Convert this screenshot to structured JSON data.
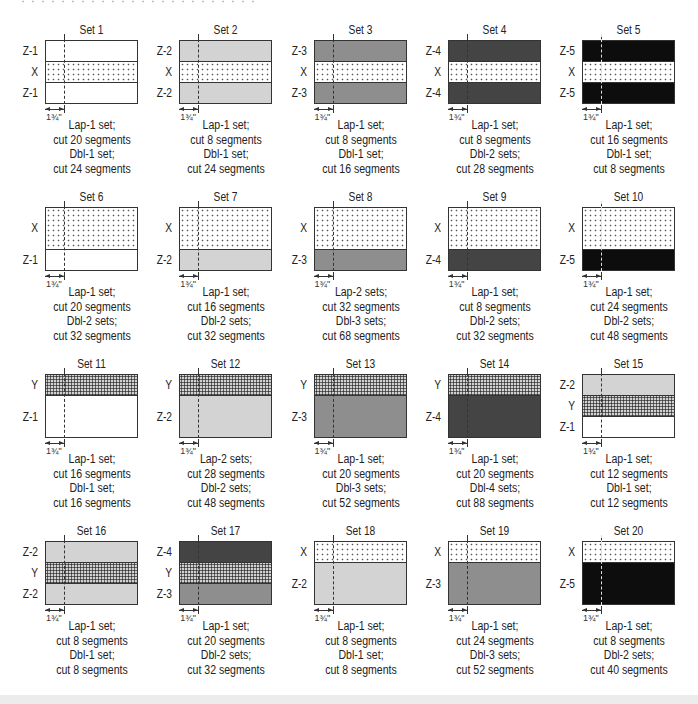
{
  "diagram": {
    "measure_label": "1¾\"",
    "colors": {
      "Z-1": "#ffffff",
      "Z-2": "#d3d3d3",
      "Z-3": "#8e8e8e",
      "Z-4": "#444444",
      "Z-5": "#0d0d0d",
      "X": "dotted white",
      "Y": "dense crosshatch gray"
    },
    "sets": [
      {
        "title": "Set 1",
        "strips": [
          {
            "label": "Z-1",
            "fill": "Z-1",
            "h": 1
          },
          {
            "label": "X",
            "fill": "X",
            "h": 1
          },
          {
            "label": "Z-1",
            "fill": "Z-1",
            "h": 1
          }
        ],
        "caption": [
          "Lap-1 set;",
          "cut 20 segments",
          "Dbl-1 set;",
          "cut 24 segments"
        ]
      },
      {
        "title": "Set 2",
        "strips": [
          {
            "label": "Z-2",
            "fill": "Z-2",
            "h": 1
          },
          {
            "label": "X",
            "fill": "X",
            "h": 1
          },
          {
            "label": "Z-2",
            "fill": "Z-2",
            "h": 1
          }
        ],
        "caption": [
          "Lap-1 set;",
          "cut 8 segments",
          "Dbl-1 set;",
          "cut 24 segments"
        ]
      },
      {
        "title": "Set 3",
        "strips": [
          {
            "label": "Z-3",
            "fill": "Z-3",
            "h": 1
          },
          {
            "label": "X",
            "fill": "X",
            "h": 1
          },
          {
            "label": "Z-3",
            "fill": "Z-3",
            "h": 1
          }
        ],
        "caption": [
          "Lap-1 set;",
          "cut 8 segments",
          "Dbl-1 set;",
          "cut 16 segments"
        ]
      },
      {
        "title": "Set 4",
        "strips": [
          {
            "label": "Z-4",
            "fill": "Z-4",
            "h": 1
          },
          {
            "label": "X",
            "fill": "X",
            "h": 1
          },
          {
            "label": "Z-4",
            "fill": "Z-4",
            "h": 1
          }
        ],
        "caption": [
          "Lap-1 set;",
          "cut 8 segments",
          "Dbl-2 sets;",
          "cut 28 segments"
        ]
      },
      {
        "title": "Set 5",
        "strips": [
          {
            "label": "Z-5",
            "fill": "Z-5",
            "h": 1
          },
          {
            "label": "X",
            "fill": "X",
            "h": 1
          },
          {
            "label": "Z-5",
            "fill": "Z-5",
            "h": 1
          }
        ],
        "caption": [
          "Lap-1 set;",
          "cut 16 segments",
          "Dbl-1 set;",
          "cut 8 segments"
        ]
      },
      {
        "title": "Set 6",
        "strips": [
          {
            "label": "X",
            "fill": "X",
            "h": 2
          },
          {
            "label": "Z-1",
            "fill": "Z-1",
            "h": 1
          }
        ],
        "caption": [
          "Lap-1 set;",
          "cut 20 segments",
          "Dbl-2 sets;",
          "cut 32 segments"
        ]
      },
      {
        "title": "Set 7",
        "strips": [
          {
            "label": "X",
            "fill": "X",
            "h": 2
          },
          {
            "label": "Z-2",
            "fill": "Z-2",
            "h": 1
          }
        ],
        "caption": [
          "Lap-1 set;",
          "cut 16 segments",
          "Dbl-2 sets;",
          "cut 32 segments"
        ]
      },
      {
        "title": "Set 8",
        "strips": [
          {
            "label": "X",
            "fill": "X",
            "h": 2
          },
          {
            "label": "Z-3",
            "fill": "Z-3",
            "h": 1
          }
        ],
        "caption": [
          "Lap-2 sets;",
          "cut 32 segments",
          "Dbl-3 sets;",
          "cut 68 segments"
        ]
      },
      {
        "title": "Set 9",
        "strips": [
          {
            "label": "X",
            "fill": "X",
            "h": 2
          },
          {
            "label": "Z-4",
            "fill": "Z-4",
            "h": 1
          }
        ],
        "caption": [
          "Lap-1 set;",
          "cut 8 segments",
          "Dbl-2 sets;",
          "cut 32 segments"
        ]
      },
      {
        "title": "Set 10",
        "strips": [
          {
            "label": "X",
            "fill": "X",
            "h": 2
          },
          {
            "label": "Z-5",
            "fill": "Z-5",
            "h": 1
          }
        ],
        "caption": [
          "Lap-1 set;",
          "cut 24 segments",
          "Dbl-2 sets;",
          "cut 48 segments"
        ]
      },
      {
        "title": "Set 11",
        "strips": [
          {
            "label": "Y",
            "fill": "Y",
            "h": 1
          },
          {
            "label": "Z-1",
            "fill": "Z-1",
            "h": 2
          }
        ],
        "caption": [
          "Lap-1 set;",
          "cut 16 segments",
          "Dbl-1 set;",
          "cut 16 segments"
        ]
      },
      {
        "title": "Set 12",
        "strips": [
          {
            "label": "Y",
            "fill": "Y",
            "h": 1
          },
          {
            "label": "Z-2",
            "fill": "Z-2",
            "h": 2
          }
        ],
        "caption": [
          "Lap-2 sets;",
          "cut 28 segments",
          "Dbl-2 sets;",
          "cut 48 segments"
        ]
      },
      {
        "title": "Set 13",
        "strips": [
          {
            "label": "Y",
            "fill": "Y",
            "h": 1
          },
          {
            "label": "Z-3",
            "fill": "Z-3",
            "h": 2
          }
        ],
        "caption": [
          "Lap-1 set;",
          "cut 20 segments",
          "Dbl-3 sets;",
          "cut 52 segments"
        ]
      },
      {
        "title": "Set 14",
        "strips": [
          {
            "label": "Y",
            "fill": "Y",
            "h": 1
          },
          {
            "label": "Z-4",
            "fill": "Z-4",
            "h": 2
          }
        ],
        "caption": [
          "Lap-1 set;",
          "cut 20 segments",
          "Dbl-4 sets;",
          "cut 88 segments"
        ]
      },
      {
        "title": "Set 15",
        "strips": [
          {
            "label": "Z-2",
            "fill": "Z-2",
            "h": 1
          },
          {
            "label": "Y",
            "fill": "Y",
            "h": 1
          },
          {
            "label": "Z-1",
            "fill": "Z-1",
            "h": 1
          }
        ],
        "caption": [
          "Lap-1 set;",
          "cut 12 segments",
          "Dbl-1 set;",
          "cut 12 segments"
        ]
      },
      {
        "title": "Set 16",
        "strips": [
          {
            "label": "Z-2",
            "fill": "Z-2",
            "h": 1
          },
          {
            "label": "Y",
            "fill": "Y",
            "h": 1
          },
          {
            "label": "Z-2",
            "fill": "Z-2",
            "h": 1
          }
        ],
        "caption": [
          "Lap-1 set;",
          "cut 8 segments",
          "Dbl-1 set;",
          "cut 8 segments"
        ]
      },
      {
        "title": "Set 17",
        "strips": [
          {
            "label": "Z-4",
            "fill": "Z-4",
            "h": 1
          },
          {
            "label": "Y",
            "fill": "Y",
            "h": 1
          },
          {
            "label": "Z-3",
            "fill": "Z-3",
            "h": 1
          }
        ],
        "caption": [
          "Lap-1 set;",
          "cut 20 segments",
          "Dbl-2 sets;",
          "cut 32 segments"
        ]
      },
      {
        "title": "Set 18",
        "strips": [
          {
            "label": "X",
            "fill": "X",
            "h": 1
          },
          {
            "label": "Z-2",
            "fill": "Z-2",
            "h": 2
          }
        ],
        "caption": [
          "Lap-1 set;",
          "cut 8 segments",
          "Dbl-1 set;",
          "cut 8 segments"
        ]
      },
      {
        "title": "Set 19",
        "strips": [
          {
            "label": "X",
            "fill": "X",
            "h": 1
          },
          {
            "label": "Z-3",
            "fill": "Z-3",
            "h": 2
          }
        ],
        "caption": [
          "Lap-1 set;",
          "cut 24 segments",
          "Dbl-3 sets;",
          "cut 52 segments"
        ]
      },
      {
        "title": "Set 20",
        "strips": [
          {
            "label": "X",
            "fill": "X",
            "h": 1
          },
          {
            "label": "Z-5",
            "fill": "Z-5",
            "h": 2
          }
        ],
        "caption": [
          "Lap-1 set;",
          "cut 8 segments",
          "Dbl-2 sets;",
          "cut 40 segments"
        ]
      }
    ]
  }
}
